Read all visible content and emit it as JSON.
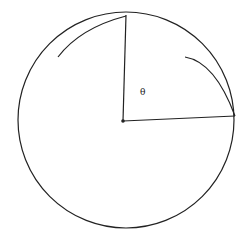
{
  "diagram": {
    "type": "circle-sector",
    "labels": {
      "angle": "θ"
    },
    "circle": {
      "cx": 126,
      "cy": 120,
      "r": 108
    },
    "center_point": {
      "x": 123,
      "y": 121
    },
    "radii": [
      {
        "x1": 123,
        "y1": 121,
        "x2": 126,
        "y2": 15
      },
      {
        "x1": 123,
        "y1": 121,
        "x2": 235,
        "y2": 116
      }
    ],
    "colors": {
      "stroke": "#222222",
      "background": "#ffffff"
    }
  }
}
